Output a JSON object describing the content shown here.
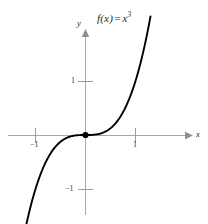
{
  "figure": {
    "function_label": {
      "prefix": "f(x)",
      "equals": "=",
      "base": "x",
      "exponent": "3"
    },
    "axis_labels": {
      "x": "x",
      "y": "y"
    },
    "tick_labels": {
      "x_neg1": "−1",
      "x_1": "1",
      "y_1": "1",
      "y_neg1": "−1"
    },
    "colors": {
      "curve": "#000000",
      "axis": "#a8a8a8",
      "tick": "#9a9a9a",
      "text": "#231f20",
      "background": "#ffffff",
      "origin_dot": "#000000"
    }
  },
  "chart_data": {
    "type": "line",
    "xlabel": "x",
    "ylabel": "y",
    "grid": false,
    "legend": null,
    "xlim": [
      -1.72,
      2.06
    ],
    "ylim": [
      -1.64,
      1.94
    ],
    "xticks": [
      -1,
      1
    ],
    "yticks": [
      -1,
      1
    ],
    "xtick_labels": [
      "−1",
      "1"
    ],
    "ytick_labels": [
      "−1",
      "1"
    ],
    "annotations": [
      {
        "text": "f(x) = x^3",
        "x": 0.45,
        "y": 1.85
      }
    ],
    "markers": [
      {
        "label": "origin",
        "x": 0,
        "y": 0,
        "style": "filled-dot"
      }
    ],
    "series": [
      {
        "name": "f(x) = x^3",
        "expression": "y = x**3",
        "x": [
          -1.23,
          -1.15,
          -1.05,
          -0.95,
          -0.85,
          -0.75,
          -0.65,
          -0.55,
          -0.45,
          -0.35,
          -0.25,
          -0.15,
          -0.05,
          0,
          0.05,
          0.15,
          0.25,
          0.35,
          0.45,
          0.55,
          0.65,
          0.75,
          0.85,
          0.95,
          1.05,
          1.15,
          1.25,
          1.3
        ],
        "y": [
          -1.861,
          -1.521,
          -1.158,
          -0.857,
          -0.614,
          -0.422,
          -0.275,
          -0.166,
          -0.091,
          -0.043,
          -0.016,
          -0.003,
          0,
          0,
          0,
          0.003,
          0.016,
          0.043,
          0.091,
          0.166,
          0.275,
          0.422,
          0.614,
          0.857,
          1.158,
          1.521,
          1.953,
          2.197
        ]
      }
    ]
  }
}
